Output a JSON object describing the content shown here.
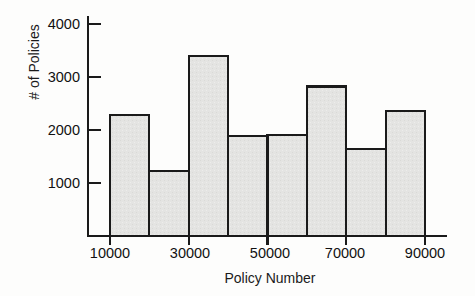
{
  "chart_data": {
    "type": "bar",
    "title": "",
    "xlabel": "Policy Number",
    "ylabel": "# of Policies",
    "categories": [
      "10000-20000",
      "20000-30000",
      "30000-40000",
      "40000-50000",
      "50000-60000",
      "60000-70000",
      "70000-80000",
      "80000-90000"
    ],
    "bin_edges": [
      10000,
      20000,
      30000,
      40000,
      50000,
      60000,
      70000,
      80000,
      90000
    ],
    "values": [
      2280,
      1220,
      3400,
      1880,
      1900,
      2820,
      1650,
      2350
    ],
    "xlim": [
      10000,
      90000
    ],
    "ylim": [
      0,
      4250
    ],
    "xticks": [
      "10000",
      "30000",
      "50000",
      "70000",
      "90000"
    ],
    "xtick_values": [
      10000,
      30000,
      50000,
      70000,
      90000
    ],
    "yticks": [
      "1000",
      "2000",
      "3000",
      "4000"
    ],
    "ytick_values": [
      1000,
      2000,
      3000,
      4000
    ],
    "grid": false,
    "legend": false,
    "bar_fill": "#e3e3e1",
    "bar_edge": "#1a1a1a",
    "axis_color": "#1a1a1a"
  }
}
